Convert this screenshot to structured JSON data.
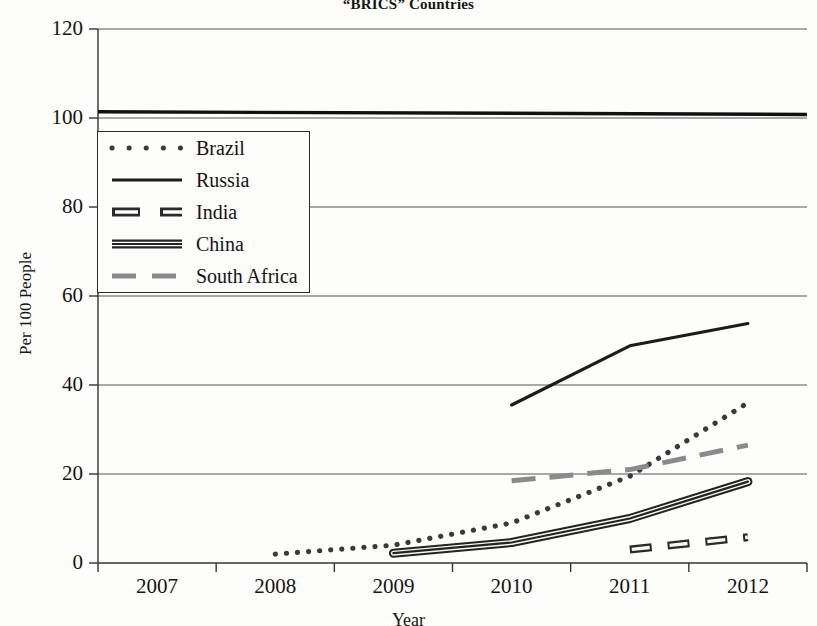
{
  "chart_data": {
    "type": "line",
    "title": "“BRICS” Countries",
    "xlabel": "Year",
    "ylabel": "Per 100 People",
    "categories": [
      "2007",
      "2008",
      "2009",
      "2010",
      "2011",
      "2012"
    ],
    "x": [
      2007,
      2008,
      2009,
      2010,
      2011,
      2012
    ],
    "ylim": [
      0,
      120
    ],
    "yticks": [
      0,
      20,
      40,
      60,
      80,
      100,
      120
    ],
    "grid": "horizontal",
    "legend_position": "upper-left-inside",
    "series": [
      {
        "name": "Brazil",
        "style": "dotted",
        "color": "#3a3a3a",
        "x": [
          2008,
          2009,
          2010,
          2011,
          2012
        ],
        "values": [
          2.0,
          4.0,
          9.0,
          19.5,
          36.0
        ]
      },
      {
        "name": "Russia",
        "style": "solid",
        "color": "#1b1b1b",
        "x": [
          2010,
          2011,
          2012
        ],
        "values": [
          35.5,
          48.8,
          53.8
        ]
      },
      {
        "name": "India",
        "style": "dashed-thick",
        "color": "#2a2a2a",
        "x": [
          2011,
          2012
        ],
        "values": [
          3.0,
          5.8
        ]
      },
      {
        "name": "China",
        "style": "double-solid-thick",
        "color": "#222222",
        "x": [
          2009,
          2010,
          2011,
          2012
        ],
        "values": [
          2.2,
          4.6,
          10.0,
          18.3
        ]
      },
      {
        "name": "South Africa",
        "style": "dashed",
        "color": "#8a8a8a",
        "x": [
          2010,
          2011,
          2012
        ],
        "values": [
          18.5,
          21.0,
          26.5
        ]
      }
    ],
    "top_line_note": "100 reference line drawn across full plot width"
  },
  "axis": {
    "y_tick_labels": [
      "120",
      "100",
      "80",
      "60",
      "40",
      "20",
      "0"
    ],
    "x_tick_labels": [
      "2007",
      "2008",
      "2009",
      "2010",
      "2011",
      "2012"
    ]
  },
  "legend": {
    "entries": [
      {
        "label": "Brazil"
      },
      {
        "label": "Russia"
      },
      {
        "label": "India"
      },
      {
        "label": "China"
      },
      {
        "label": "South Africa"
      }
    ]
  }
}
